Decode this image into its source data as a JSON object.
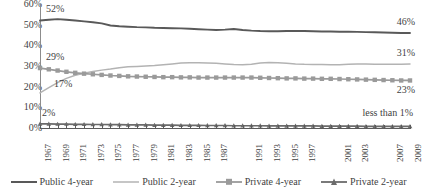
{
  "chart_data": {
    "type": "line",
    "title": "",
    "xlabel": "",
    "ylabel": "",
    "ylim": [
      0,
      60
    ],
    "ytick_labels": [
      "60%",
      "50%",
      "40%",
      "30%",
      "20%",
      "10%",
      "0%"
    ],
    "ytick_values": [
      60,
      50,
      40,
      30,
      20,
      10,
      0
    ],
    "grid": false,
    "legend_position": "bottom",
    "x": [
      1967,
      1968,
      1969,
      1970,
      1971,
      1972,
      1973,
      1974,
      1975,
      1976,
      1977,
      1978,
      1979,
      1980,
      1981,
      1982,
      1983,
      1984,
      1985,
      1986,
      1987,
      1988,
      1989,
      1990,
      1991,
      1992,
      1993,
      1994,
      1995,
      1996,
      1997,
      1998,
      1999,
      2000,
      2001,
      2002,
      2003,
      2004,
      2005,
      2006,
      2007,
      2008,
      2009
    ],
    "xtick_labels": [
      "1967",
      "1969",
      "1971",
      "1973",
      "1975",
      "1977",
      "1979",
      "1981",
      "1983",
      "1985",
      "1987",
      "1991",
      "1993",
      "1995",
      "1997",
      "2001",
      "2003",
      "2007",
      "2009"
    ],
    "xtick_label_years": [
      1967,
      1969,
      1971,
      1973,
      1975,
      1977,
      1979,
      1981,
      1983,
      1985,
      1987,
      1991,
      1993,
      1995,
      1997,
      2001,
      2003,
      2007,
      2009
    ],
    "series": [
      {
        "name": "Public 4-year",
        "color": "#595959",
        "style": "thick-line",
        "start_label": "52%",
        "end_label": "46%",
        "values": [
          52,
          52.4,
          52.7,
          52.4,
          52,
          51.6,
          51.2,
          50.6,
          49.6,
          49.2,
          49,
          48.8,
          48.7,
          48.5,
          48.4,
          48.3,
          48.2,
          48,
          47.8,
          47.6,
          47.4,
          47.6,
          47.9,
          47.4,
          47.1,
          46.9,
          46.8,
          46.8,
          46.9,
          47,
          46.9,
          46.8,
          46.7,
          46.7,
          46.6,
          46.6,
          46.5,
          46.4,
          46.3,
          46.2,
          46.1,
          46,
          46
        ]
      },
      {
        "name": "Public 2-year",
        "color": "#b3b3b3",
        "style": "thin-line",
        "start_label": "17%",
        "end_label": "31%",
        "values": [
          17,
          19.5,
          22,
          24,
          25.5,
          26.5,
          27.3,
          28,
          28.5,
          29.2,
          29.6,
          29.8,
          30,
          30.2,
          30.6,
          31,
          31.4,
          31.6,
          31.6,
          31.5,
          31.3,
          31,
          30.7,
          30.6,
          30.8,
          31.4,
          31.7,
          31.6,
          31.3,
          31,
          30.8,
          30.7,
          30.7,
          30.6,
          30.6,
          30.8,
          31,
          31,
          30.9,
          30.8,
          30.8,
          30.9,
          31
        ]
      },
      {
        "name": "Private 4-year",
        "color": "#9a9a9a",
        "style": "square-markers",
        "start_label": "29%",
        "end_label": "23%",
        "values": [
          29,
          28.4,
          27.8,
          27.2,
          26.7,
          26.3,
          26,
          25.7,
          25.4,
          25.2,
          25,
          24.9,
          24.8,
          24.7,
          24.6,
          24.6,
          24.5,
          24.5,
          24.4,
          24.4,
          24.4,
          24.4,
          24.4,
          24.4,
          24.4,
          24.3,
          24.2,
          24.1,
          24,
          24,
          23.9,
          23.9,
          23.8,
          23.8,
          23.7,
          23.6,
          23.5,
          23.4,
          23.3,
          23.2,
          23.1,
          23,
          23
        ]
      },
      {
        "name": "Private 2-year",
        "color": "#6b6b6b",
        "style": "small-markers",
        "start_label": "2%",
        "end_label": "less than 1%",
        "values": [
          2,
          2,
          1.9,
          1.9,
          1.8,
          1.8,
          1.7,
          1.7,
          1.6,
          1.6,
          1.5,
          1.5,
          1.5,
          1.4,
          1.4,
          1.4,
          1.3,
          1.3,
          1.3,
          1.2,
          1.2,
          1.2,
          1.1,
          1.1,
          1.1,
          1.1,
          1,
          1,
          1,
          1,
          1,
          1,
          0.9,
          0.9,
          0.9,
          0.9,
          0.9,
          0.8,
          0.8,
          0.8,
          0.8,
          0.8,
          0.8
        ]
      }
    ]
  },
  "legend": {
    "items": [
      {
        "label": "Public 4-year"
      },
      {
        "label": "Public 2-year"
      },
      {
        "label": "Private 4-year"
      },
      {
        "label": "Private 2-year"
      }
    ]
  }
}
